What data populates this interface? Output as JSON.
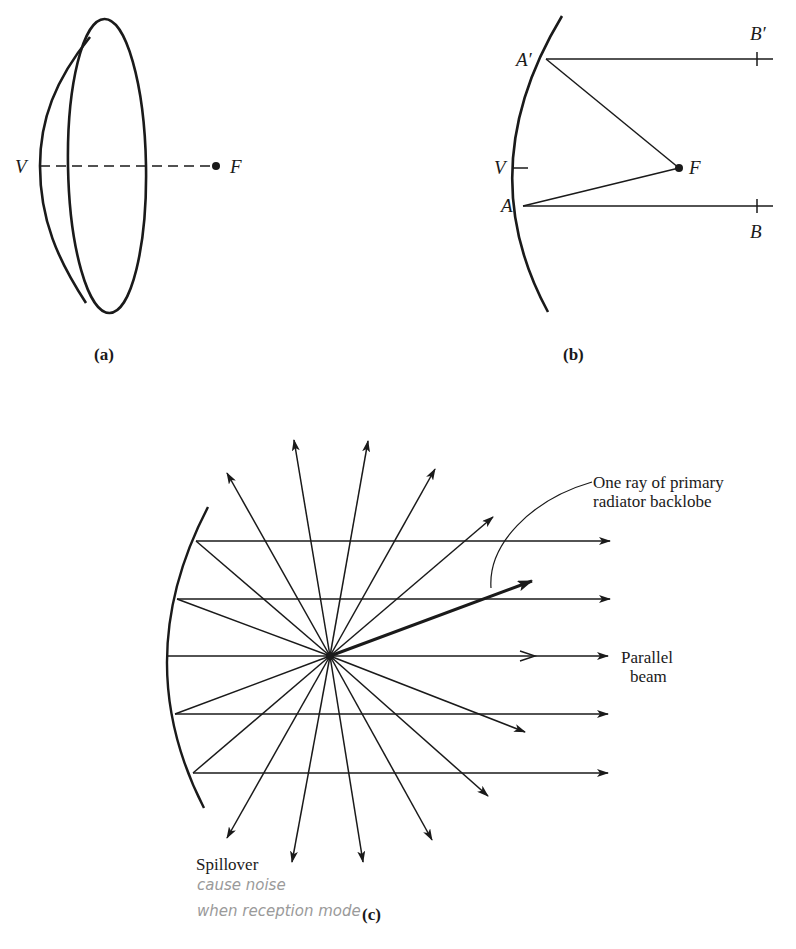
{
  "figure_a": {
    "caption": "(a)",
    "labels": {
      "vertex": "V",
      "focus": "F"
    }
  },
  "figure_b": {
    "caption": "(b)",
    "labels": {
      "a_prime": "A′",
      "b_prime": "B′",
      "vertex": "V",
      "focus": "F",
      "a": "A",
      "b": "B"
    }
  },
  "figure_c": {
    "caption": "(c)",
    "annotation_backlobe_line1": "One ray of primary",
    "annotation_backlobe_line2": "radiator backlobe",
    "annotation_beam_line1": "Parallel",
    "annotation_beam_line2": "beam",
    "annotation_spillover": "Spillover",
    "handwritten_note_line1": "cause noise",
    "handwritten_note_line2": "when reception mode"
  },
  "colors": {
    "ink": "#1a1a1a",
    "pencil": "#9a9a9a",
    "background": "#ffffff"
  }
}
